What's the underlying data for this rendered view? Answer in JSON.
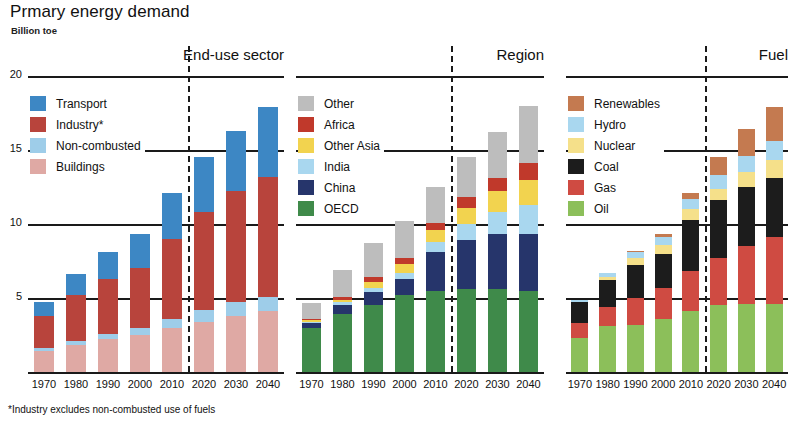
{
  "title": "Prmary energy demand",
  "subtitle": "Billion toe",
  "footnote": "*Industry excludes non-combusted use of fuels",
  "axis": {
    "ticks": [
      "20",
      "15",
      "10",
      "5"
    ],
    "tick_values": [
      20,
      15,
      10,
      5
    ],
    "ylim": [
      0,
      20
    ]
  },
  "years": [
    "1970",
    "1980",
    "1990",
    "2000",
    "2010",
    "2020",
    "2030",
    "2040"
  ],
  "panels": [
    {
      "title": "End-use sector"
    },
    {
      "title": "Region"
    },
    {
      "title": "Fuel"
    }
  ],
  "colors": {
    "transport": "#3d87c4",
    "industry": "#b8443c",
    "non_combusted": "#9ecde9",
    "buildings": "#dfa9a4",
    "other": "#bdbdbd",
    "africa": "#c0392b",
    "other_asia": "#f2d34f",
    "india": "#a9d7ef",
    "china": "#26356b",
    "oecd": "#3f8a4a",
    "renewables": "#c47a50",
    "hydro": "#a9d7ef",
    "nuclear": "#f5e08a",
    "coal": "#1c1c1c",
    "gas": "#cf4b42",
    "oil": "#8cbf5a"
  },
  "chart_data": [
    {
      "type": "bar",
      "title": "End-use sector",
      "stacked": true,
      "xlabel": "",
      "ylabel": "Billion toe",
      "ylim": [
        0,
        20
      ],
      "grid": true,
      "legend_position": "top-left",
      "categories": [
        "1970",
        "1980",
        "1990",
        "2000",
        "2010",
        "2020",
        "2030",
        "2040"
      ],
      "series": [
        {
          "name": "Buildings",
          "color": "#dfa9a4",
          "values": [
            1.4,
            1.8,
            2.2,
            2.5,
            3.0,
            3.4,
            3.8,
            4.1
          ]
        },
        {
          "name": "Non-combusted",
          "color": "#9ecde9",
          "values": [
            0.2,
            0.3,
            0.4,
            0.5,
            0.6,
            0.8,
            0.9,
            1.0
          ]
        },
        {
          "name": "Industry*",
          "color": "#b8443c",
          "values": [
            2.2,
            3.1,
            3.7,
            4.0,
            5.4,
            6.6,
            7.5,
            8.1
          ]
        },
        {
          "name": "Transport",
          "color": "#3d87c4",
          "values": [
            0.9,
            1.4,
            1.8,
            2.3,
            3.1,
            3.7,
            4.1,
            4.7
          ]
        }
      ]
    },
    {
      "type": "bar",
      "title": "Region",
      "stacked": true,
      "xlabel": "",
      "ylabel": "Billion toe",
      "ylim": [
        0,
        20
      ],
      "grid": true,
      "legend_position": "top-left",
      "categories": [
        "1970",
        "1980",
        "1990",
        "2000",
        "2010",
        "2020",
        "2030",
        "2040"
      ],
      "series": [
        {
          "name": "OECD",
          "color": "#3f8a4a",
          "values": [
            3.0,
            3.9,
            4.5,
            5.2,
            5.5,
            5.6,
            5.6,
            5.5
          ]
        },
        {
          "name": "China",
          "color": "#26356b",
          "values": [
            0.3,
            0.6,
            0.9,
            1.1,
            2.6,
            3.3,
            3.7,
            3.8
          ]
        },
        {
          "name": "India",
          "color": "#a9d7ef",
          "values": [
            0.1,
            0.2,
            0.3,
            0.4,
            0.7,
            1.1,
            1.5,
            2.0
          ]
        },
        {
          "name": "Other Asia",
          "color": "#f2d34f",
          "values": [
            0.1,
            0.2,
            0.4,
            0.6,
            0.8,
            1.1,
            1.4,
            1.7
          ]
        },
        {
          "name": "Africa",
          "color": "#c0392b",
          "values": [
            0.1,
            0.2,
            0.3,
            0.4,
            0.5,
            0.7,
            0.9,
            1.1
          ]
        },
        {
          "name": "Other",
          "color": "#bdbdbd",
          "values": [
            1.1,
            1.8,
            2.3,
            2.5,
            2.4,
            2.7,
            3.1,
            3.9
          ]
        }
      ]
    },
    {
      "type": "bar",
      "title": "Fuel",
      "stacked": true,
      "xlabel": "",
      "ylabel": "Billion toe",
      "ylim": [
        0,
        20
      ],
      "grid": true,
      "legend_position": "top-left",
      "categories": [
        "1970",
        "1980",
        "1990",
        "2000",
        "2010",
        "2020",
        "2030",
        "2040"
      ],
      "series": [
        {
          "name": "Oil",
          "color": "#8cbf5a",
          "values": [
            2.3,
            3.1,
            3.2,
            3.6,
            4.1,
            4.5,
            4.6,
            4.6
          ]
        },
        {
          "name": "Gas",
          "color": "#cf4b42",
          "values": [
            1.0,
            1.3,
            1.8,
            2.1,
            2.7,
            3.2,
            3.9,
            4.5
          ]
        },
        {
          "name": "Coal",
          "color": "#1c1c1c",
          "values": [
            1.4,
            1.8,
            2.2,
            2.3,
            3.5,
            3.9,
            4.0,
            4.0
          ]
        },
        {
          "name": "Nuclear",
          "color": "#f5e08a",
          "values": [
            0.0,
            0.2,
            0.5,
            0.6,
            0.7,
            0.8,
            1.0,
            1.2
          ]
        },
        {
          "name": "Hydro",
          "color": "#a9d7ef",
          "values": [
            0.2,
            0.3,
            0.4,
            0.5,
            0.7,
            0.9,
            1.1,
            1.3
          ]
        },
        {
          "name": "Renewables",
          "color": "#c47a50",
          "values": [
            0.0,
            0.0,
            0.1,
            0.2,
            0.4,
            1.2,
            1.8,
            2.3
          ]
        }
      ]
    }
  ],
  "legends": [
    {
      "name": "end-use-sector",
      "items": [
        {
          "label": "Transport",
          "color": "#3d87c4"
        },
        {
          "label": "Industry*",
          "color": "#b8443c"
        },
        {
          "label": "Non-combusted",
          "color": "#9ecde9"
        },
        {
          "label": "Buildings",
          "color": "#dfa9a4"
        }
      ]
    },
    {
      "name": "region",
      "items": [
        {
          "label": "Other",
          "color": "#bdbdbd"
        },
        {
          "label": "Africa",
          "color": "#c0392b"
        },
        {
          "label": "Other Asia",
          "color": "#f2d34f"
        },
        {
          "label": "India",
          "color": "#a9d7ef"
        },
        {
          "label": "China",
          "color": "#26356b"
        },
        {
          "label": "OECD",
          "color": "#3f8a4a"
        }
      ]
    },
    {
      "name": "fuel",
      "items": [
        {
          "label": "Renewables",
          "color": "#c47a50"
        },
        {
          "label": "Hydro",
          "color": "#a9d7ef"
        },
        {
          "label": "Nuclear",
          "color": "#f5e08a"
        },
        {
          "label": "Coal",
          "color": "#1c1c1c"
        },
        {
          "label": "Gas",
          "color": "#cf4b42"
        },
        {
          "label": "Oil",
          "color": "#8cbf5a"
        }
      ]
    }
  ]
}
